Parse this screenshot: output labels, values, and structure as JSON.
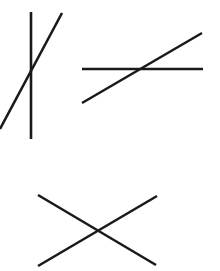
{
  "diagram": {
    "stroke_color": "#1a1a1a",
    "stroke_width": 2.6,
    "figures": [
      {
        "id": "pair-1",
        "description": "vertical line crossed by steep diagonal",
        "lines": [
          {
            "x1": 31,
            "y1": 12,
            "x2": 31,
            "y2": 139
          },
          {
            "x1": 62,
            "y1": 13,
            "x2": 0,
            "y2": 129
          }
        ]
      },
      {
        "id": "pair-2",
        "description": "horizontal line crossed by shallow diagonal",
        "lines": [
          {
            "x1": 82,
            "y1": 69,
            "x2": 203,
            "y2": 69
          },
          {
            "x1": 82,
            "y1": 103,
            "x2": 202,
            "y2": 33
          }
        ]
      },
      {
        "id": "pair-3",
        "description": "two diagonals forming an X",
        "lines": [
          {
            "x1": 38,
            "y1": 195,
            "x2": 156,
            "y2": 265
          },
          {
            "x1": 38,
            "y1": 266,
            "x2": 157,
            "y2": 196
          }
        ]
      }
    ]
  }
}
